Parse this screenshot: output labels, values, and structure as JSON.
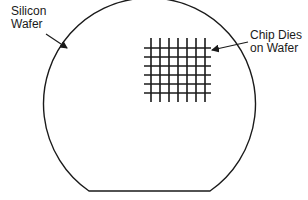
{
  "diagram": {
    "labels": {
      "wafer_line1": "Silicon",
      "wafer_line2": "Wafer",
      "dies_line1": "Chip Dies",
      "dies_line2": "on Wafer"
    },
    "colors": {
      "stroke": "#1a1a1a",
      "background": "#ffffff"
    }
  }
}
